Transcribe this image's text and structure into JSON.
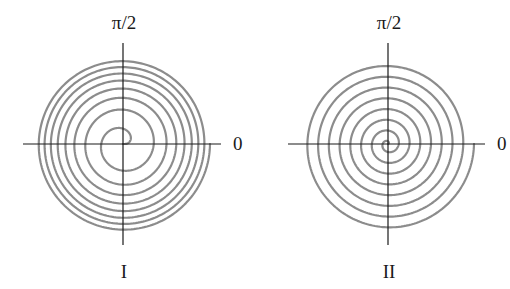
{
  "figure": {
    "background": "#ffffff",
    "axis_color": "#1a1a1a",
    "curve_color": "#8c8c8c"
  },
  "panels": [
    {
      "id": "I",
      "label": "I",
      "angle_label_top": "π/2",
      "angle_label_right": "0",
      "center": [
        123,
        144
      ],
      "axis": {
        "x_min": 23,
        "x_max": 221,
        "y_min": 43,
        "y_max": 245
      },
      "top_label_pos": [
        124,
        29
      ],
      "right_label_pos": [
        233,
        150
      ],
      "panel_label_pos": [
        124,
        278
      ],
      "spiral": {
        "type": "sqrt",
        "description": "r proportional to sqrt(theta); rings crowd together moving outward",
        "turns": 8,
        "max_radius": 87,
        "end_angle_deg": 0
      }
    },
    {
      "id": "II",
      "label": "II",
      "angle_label_top": "π/2",
      "angle_label_right": "0",
      "center": [
        388,
        144
      ],
      "axis": {
        "x_min": 288,
        "x_max": 485,
        "y_min": 43,
        "y_max": 245
      },
      "top_label_pos": [
        389,
        29
      ],
      "right_label_pos": [
        497,
        150
      ],
      "panel_label_pos": [
        389,
        278
      ],
      "spiral": {
        "type": "archimedean",
        "description": "r proportional to theta; evenly spaced rings",
        "turns": 8,
        "max_radius": 86,
        "end_angle_deg": 0
      }
    }
  ]
}
